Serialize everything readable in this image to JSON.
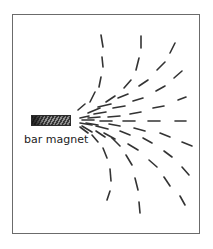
{
  "diagram": {
    "label": "bar magnet",
    "colors": {
      "frame": "#6b6b6b",
      "dash": "#333333",
      "text": "#222222"
    },
    "dashes": [
      [
        101,
        35,
        103,
        47
      ],
      [
        102,
        57,
        103,
        67
      ],
      [
        101,
        77,
        99,
        87
      ],
      [
        95,
        92,
        90,
        102
      ],
      [
        85,
        104,
        78,
        110
      ],
      [
        141,
        36,
        141,
        48
      ],
      [
        139,
        58,
        136,
        70
      ],
      [
        131,
        80,
        124,
        88
      ],
      [
        115,
        96,
        106,
        102
      ],
      [
        100,
        108,
        88,
        113
      ],
      [
        175,
        43,
        170,
        53
      ],
      [
        165,
        62,
        157,
        70
      ],
      [
        148,
        80,
        139,
        86
      ],
      [
        128,
        94,
        118,
        98
      ],
      [
        111,
        104,
        98,
        107
      ],
      [
        182,
        71,
        174,
        78
      ],
      [
        165,
        86,
        156,
        91
      ],
      [
        143,
        98,
        133,
        101
      ],
      [
        125,
        106,
        113,
        108
      ],
      [
        106,
        112,
        94,
        114
      ],
      [
        186,
        97,
        178,
        100
      ],
      [
        164,
        106,
        153,
        108
      ],
      [
        141,
        112,
        130,
        114
      ],
      [
        120,
        116,
        108,
        117
      ],
      [
        100,
        117,
        88,
        118
      ],
      [
        186,
        121,
        175,
        121
      ],
      [
        160,
        121,
        148,
        121
      ],
      [
        135,
        121,
        123,
        121
      ],
      [
        112,
        121,
        100,
        121
      ],
      [
        94,
        120,
        82,
        120
      ],
      [
        80,
        118,
        89,
        116
      ],
      [
        80,
        123,
        92,
        125
      ],
      [
        192,
        146,
        182,
        142
      ],
      [
        170,
        137,
        160,
        133
      ],
      [
        145,
        131,
        134,
        128
      ],
      [
        120,
        126,
        109,
        124
      ],
      [
        98,
        125,
        86,
        123
      ],
      [
        189,
        175,
        182,
        167
      ],
      [
        172,
        157,
        164,
        151
      ],
      [
        152,
        143,
        143,
        138
      ],
      [
        130,
        135,
        120,
        131
      ],
      [
        108,
        129,
        96,
        126
      ],
      [
        185,
        205,
        180,
        196
      ],
      [
        170,
        186,
        164,
        177
      ],
      [
        157,
        167,
        149,
        160
      ],
      [
        138,
        150,
        128,
        144
      ],
      [
        115,
        139,
        104,
        133
      ],
      [
        92,
        132,
        82,
        126
      ],
      [
        140,
        213,
        139,
        202
      ],
      [
        138,
        190,
        135,
        178
      ],
      [
        132,
        165,
        126,
        155
      ],
      [
        120,
        146,
        112,
        138
      ],
      [
        105,
        137,
        96,
        131
      ],
      [
        107,
        200,
        110,
        191
      ],
      [
        111,
        181,
        110,
        169
      ],
      [
        107,
        158,
        103,
        148
      ],
      [
        98,
        142,
        92,
        135
      ],
      [
        88,
        133,
        80,
        127
      ]
    ]
  }
}
